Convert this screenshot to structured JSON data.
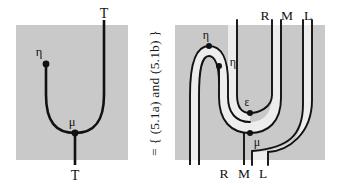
{
  "figure": {
    "kind": "string-diagram-equation",
    "colors": {
      "outer_panel_gray": "#c9c9c9",
      "inner_region_gray": "#ededed",
      "stroke": "#111111",
      "background": "#ffffff",
      "label_color": "#111111"
    },
    "relation_text": "=  {  (5.1a) and (5.1b)  }",
    "left_diagram": {
      "name": "monad-multiplication-unit-diagram",
      "panel": {
        "x": 16,
        "y": 25,
        "width": 112,
        "height": 135
      },
      "labels": {
        "top_wire": "T",
        "bottom_wire": "T",
        "unit_node": "η",
        "multiplication_node": "μ"
      },
      "nodes": [
        {
          "id": "eta",
          "label": "η",
          "x": 40,
          "y": 64
        },
        {
          "id": "mu",
          "label": "μ",
          "x": 75,
          "y": 120
        }
      ],
      "wire_labels": [
        {
          "text": "T",
          "x": 100,
          "y": 13,
          "position": "top"
        },
        {
          "text": "T",
          "x": 75,
          "y": 175,
          "position": "bottom"
        }
      ]
    },
    "right_diagram": {
      "name": "adjunction-expansion-diagram",
      "panel": {
        "x": 175,
        "y": 25,
        "width": 150,
        "height": 135
      },
      "labels": {
        "top_wires": [
          "R",
          "M",
          "L"
        ],
        "bottom_wires": [
          "R",
          "M",
          "L"
        ],
        "unit_node_outer": "η",
        "unit_node_inner": "η",
        "counit_node": "ε",
        "multiplication_node": "μ"
      },
      "nodes": [
        {
          "id": "eta-outer",
          "label": "η",
          "x": 209,
          "y": 50
        },
        {
          "id": "eta-inner",
          "label": "η",
          "x": 221,
          "y": 66
        },
        {
          "id": "epsilon",
          "label": "ε",
          "x": 245,
          "y": 103
        },
        {
          "id": "mu",
          "label": "μ",
          "x": 245,
          "y": 122
        }
      ],
      "top_wire_labels": [
        {
          "text": "R",
          "x": 265,
          "y": 15
        },
        {
          "text": "M",
          "x": 287,
          "y": 15
        },
        {
          "text": "L",
          "x": 308,
          "y": 15
        }
      ],
      "bottom_wire_labels": [
        {
          "text": "R",
          "x": 224,
          "y": 172
        },
        {
          "text": "M",
          "x": 244,
          "y": 172
        },
        {
          "text": "L",
          "x": 263,
          "y": 172
        }
      ]
    }
  }
}
